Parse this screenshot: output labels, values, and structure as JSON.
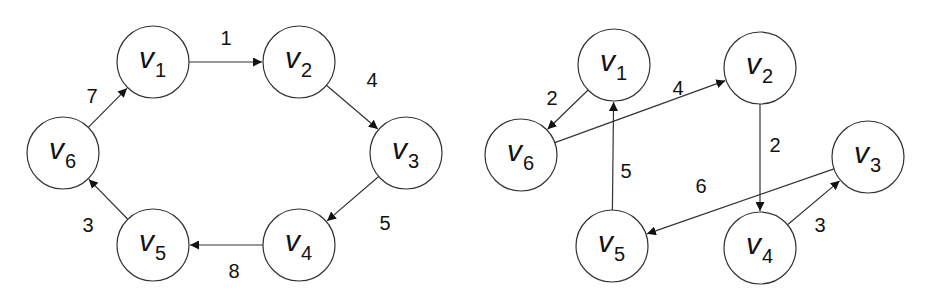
{
  "graphs": [
    {
      "name": "left-cycle-graph",
      "nodes": [
        {
          "id": "v1",
          "letter": "v",
          "sub": "1",
          "x": 153,
          "y": 62
        },
        {
          "id": "v2",
          "letter": "v",
          "sub": "2",
          "x": 299,
          "y": 62
        },
        {
          "id": "v3",
          "letter": "v",
          "sub": "3",
          "x": 406,
          "y": 153
        },
        {
          "id": "v4",
          "letter": "v",
          "sub": "4",
          "x": 299,
          "y": 245
        },
        {
          "id": "v5",
          "letter": "v",
          "sub": "5",
          "x": 153,
          "y": 245
        },
        {
          "id": "v6",
          "letter": "v",
          "sub": "6",
          "x": 63,
          "y": 153
        }
      ],
      "edges": [
        {
          "from": "v1",
          "to": "v2",
          "weight": "1",
          "lx": 226,
          "ly": 45
        },
        {
          "from": "v2",
          "to": "v3",
          "weight": "4",
          "lx": 372,
          "ly": 87
        },
        {
          "from": "v3",
          "to": "v4",
          "weight": "5",
          "lx": 385,
          "ly": 230
        },
        {
          "from": "v4",
          "to": "v5",
          "weight": "8",
          "lx": 234,
          "ly": 278
        },
        {
          "from": "v5",
          "to": "v6",
          "weight": "3",
          "lx": 88,
          "ly": 232
        },
        {
          "from": "v6",
          "to": "v1",
          "weight": "7",
          "lx": 92,
          "ly": 103
        }
      ]
    },
    {
      "name": "right-graph",
      "nodes": [
        {
          "id": "v1",
          "letter": "v",
          "sub": "1",
          "x": 614,
          "y": 65
        },
        {
          "id": "v2",
          "letter": "v",
          "sub": "2",
          "x": 760,
          "y": 68
        },
        {
          "id": "v3",
          "letter": "v",
          "sub": "3",
          "x": 868,
          "y": 157
        },
        {
          "id": "v4",
          "letter": "v",
          "sub": "4",
          "x": 760,
          "y": 248
        },
        {
          "id": "v5",
          "letter": "v",
          "sub": "5",
          "x": 612,
          "y": 246
        },
        {
          "id": "v6",
          "letter": "v",
          "sub": "6",
          "x": 521,
          "y": 155
        }
      ],
      "edges": [
        {
          "from": "v1",
          "to": "v6",
          "weight": "2",
          "lx": 552,
          "ly": 105
        },
        {
          "from": "v6",
          "to": "v2",
          "weight": "4",
          "lx": 678,
          "ly": 95
        },
        {
          "from": "v5",
          "to": "v1",
          "weight": "5",
          "lx": 626,
          "ly": 178
        },
        {
          "from": "v2",
          "to": "v4",
          "weight": "2",
          "lx": 775,
          "ly": 152
        },
        {
          "from": "v3",
          "to": "v5",
          "weight": "6",
          "lx": 701,
          "ly": 193
        },
        {
          "from": "v4",
          "to": "v3",
          "weight": "3",
          "lx": 820,
          "ly": 232
        }
      ]
    }
  ],
  "style": {
    "node_radius": 36,
    "stroke": "#333333"
  }
}
